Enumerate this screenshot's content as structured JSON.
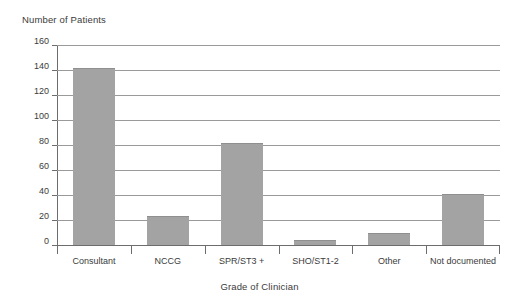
{
  "chart_data": {
    "type": "bar",
    "title": "",
    "xlabel": "Grade of Clinician",
    "ylabel": "Number of Patients",
    "categories": [
      "Consultant",
      "NCCG",
      "SPR/ST3 +",
      "SHO/ST1-2",
      "Other",
      "Not documented"
    ],
    "values": [
      142,
      23,
      82,
      4,
      10,
      41
    ],
    "ylim": [
      0,
      160
    ],
    "yticks": [
      0,
      20,
      40,
      60,
      80,
      100,
      120,
      140,
      160
    ],
    "ytick_labels": [
      "0",
      "20",
      "40",
      "60",
      "80",
      "100",
      "120",
      "140",
      "160"
    ],
    "grid": true,
    "legend": "none",
    "bar_color": "#a3a3a3",
    "axis_color": "#6d6d6d",
    "gridline_color": "#9a9a9a",
    "text_color": "#3b3b3b"
  },
  "axes": {
    "y_title": "Number of Patients",
    "x_title": "Grade of Clinician"
  }
}
